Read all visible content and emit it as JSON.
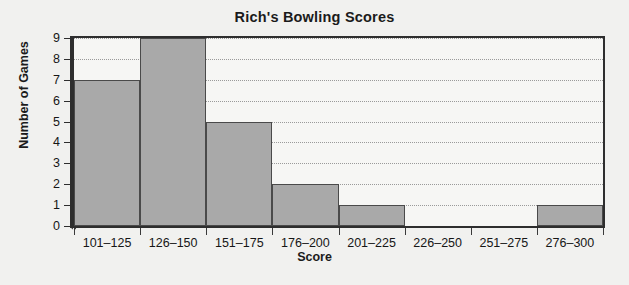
{
  "chart_data": {
    "type": "bar",
    "title": "Rich's Bowling Scores",
    "xlabel": "Score",
    "ylabel": "Number of Games",
    "categories": [
      "101–125",
      "126–150",
      "151–175",
      "176–200",
      "201–225",
      "226–250",
      "251–275",
      "276–300"
    ],
    "values": [
      7,
      9,
      5,
      2,
      1,
      0,
      0,
      1
    ],
    "ylim": [
      0,
      9
    ],
    "yticks": [
      0,
      1,
      2,
      3,
      4,
      5,
      6,
      7,
      8,
      9
    ],
    "ytick_labels": [
      "0",
      "1",
      "2",
      "3",
      "4",
      "5",
      "6",
      "7",
      "8",
      "9"
    ],
    "grid": true,
    "grid_axis": "y",
    "grid_style": "dotted",
    "legend": null,
    "axis_break_y": true,
    "bar_color": "#a9a9a9",
    "bar_edge_color": "#4a4a4a",
    "background_color": "#f1f1ef",
    "plot_background_color": "#f6f6f4",
    "axis_color": "#2e2e2e",
    "text_color": "#161616"
  }
}
